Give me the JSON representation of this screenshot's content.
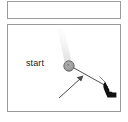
{
  "figure": {
    "top_panel": {
      "name": "empty-panel",
      "content": ""
    },
    "main_panel": {
      "label_start": "start",
      "marker": {
        "name": "start-marker",
        "shape": "circle",
        "fill_color": "#9a9a9a",
        "ring_color": "#6e6e6e",
        "center_x": 61,
        "center_y": 41,
        "radius": 5
      },
      "streak": {
        "name": "motion-streak",
        "color": "#e4e4e4",
        "from_x": 61,
        "from_y": 41,
        "to_x": 52,
        "to_y": 2
      },
      "connector": {
        "name": "drag-path",
        "color": "#3c3c3c",
        "from_x": 66,
        "from_y": 43,
        "to_x": 100,
        "to_y": 62
      },
      "annotation_arrow": {
        "name": "callout-arrow",
        "color": "#4a4a4a",
        "tail_x": 51,
        "tail_y": 73,
        "head_x": 74,
        "head_y": 52
      },
      "cursor": {
        "name": "hand-cursor",
        "color": "#111111",
        "x": 97,
        "y": 58
      }
    }
  }
}
